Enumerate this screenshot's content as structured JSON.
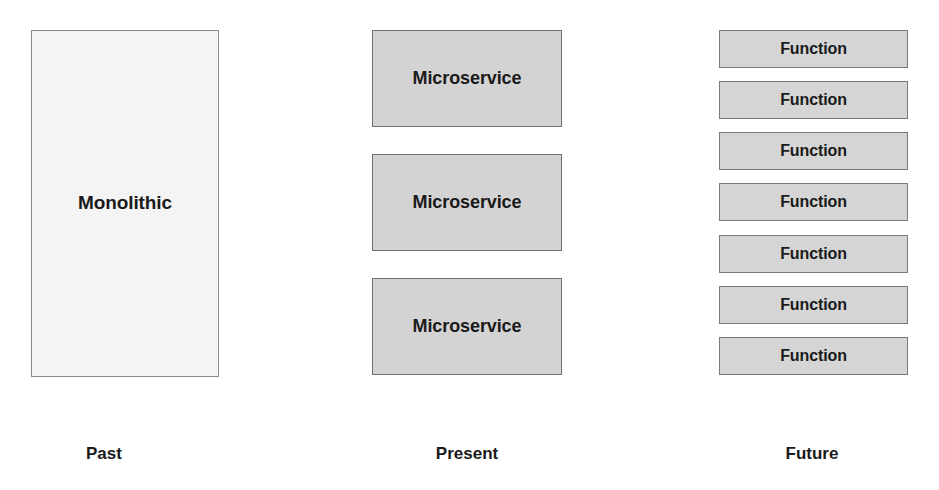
{
  "diagram": {
    "background_color": "#ffffff",
    "columns": [
      {
        "id": "past",
        "caption": "Past",
        "node_label": "Monolithic",
        "node_count": 1,
        "fill_color": "#f4f4f4",
        "border_color": "#8a8a8a",
        "nodes": [
          {
            "label": "Monolithic"
          }
        ]
      },
      {
        "id": "present",
        "caption": "Present",
        "node_label": "Microservice",
        "node_count": 3,
        "fill_color": "#d3d3d3",
        "border_color": "#6f6f6f",
        "nodes": [
          {
            "label": "Microservice"
          },
          {
            "label": "Microservice"
          },
          {
            "label": "Microservice"
          }
        ]
      },
      {
        "id": "future",
        "caption": "Future",
        "node_label": "Function",
        "node_count": 7,
        "fill_color": "#d5d5d5",
        "border_color": "#7a7a7a",
        "nodes": [
          {
            "label": "Function"
          },
          {
            "label": "Function"
          },
          {
            "label": "Function"
          },
          {
            "label": "Function"
          },
          {
            "label": "Function"
          },
          {
            "label": "Function"
          },
          {
            "label": "Function"
          }
        ]
      }
    ],
    "text_color": "#1a1a1a"
  }
}
